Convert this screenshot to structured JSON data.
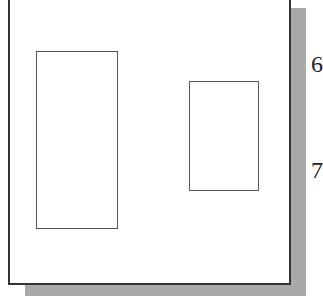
{
  "figure": {
    "labels": [
      "6",
      "7"
    ],
    "shapes": [
      "tall-rectangle",
      "short-rectangle"
    ]
  }
}
